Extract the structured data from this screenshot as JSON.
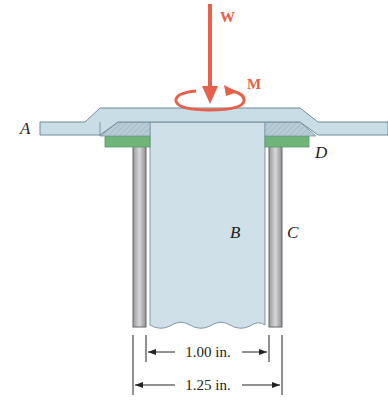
{
  "figure": {
    "labels": {
      "plate": "A",
      "rod": "B",
      "tube": "C",
      "washer": "D",
      "load": "W",
      "moment": "M"
    },
    "dimensions": {
      "inner": "1.00 in.",
      "outer": "1.25 in."
    },
    "colors": {
      "load_arrow": "#e8604c",
      "plate": "#c9dde6",
      "rod": "#cfe0e8",
      "washer": "#6fb57a",
      "tube": "#b8b8bc"
    }
  }
}
